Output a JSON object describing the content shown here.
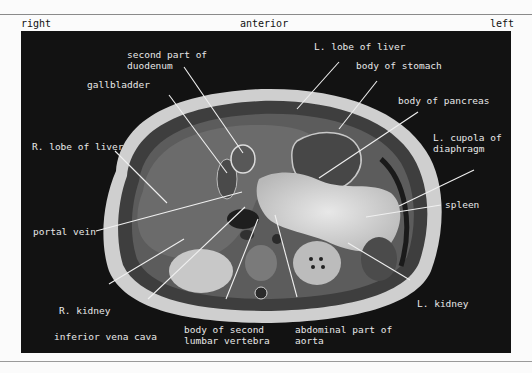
{
  "orientation": {
    "right": "right",
    "anterior": "anterior",
    "left": "left"
  },
  "figure": {
    "background": "#121212",
    "label_color": "#e8e8e8",
    "line_color": "#f0f0f0",
    "labels": {
      "second_part_duodenum": "second part of\nduodenum",
      "l_lobe_liver": "L. lobe of liver",
      "body_stomach": "body of stomach",
      "gallbladder": "gallbladder",
      "body_pancreas": "body of pancreas",
      "r_lobe_liver": "R. lobe of liver",
      "l_cupola_diaphragm": "L. cupola of\ndiaphragm",
      "spleen": "spleen",
      "portal_vein": "portal vein",
      "r_kidney": "R. kidney",
      "l_kidney": "L. kidney",
      "inferior_vena_cava": "inferior vena cava",
      "body_second_lumbar_vertebra": "body of second\nlumbar vertebra",
      "abdominal_aorta": "abdominal part of\naorta"
    }
  }
}
